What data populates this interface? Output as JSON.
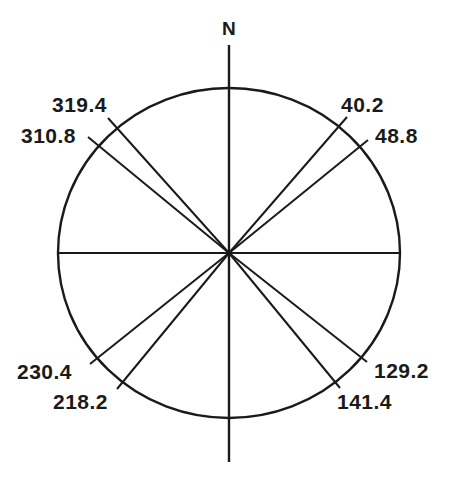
{
  "diagram": {
    "type": "compass-rose-orientation-diagram",
    "north_label": "N",
    "stroke_color": "#1a1a1a",
    "background": "#ffffff",
    "center": {
      "x": 229,
      "y": 253
    },
    "circle": {
      "rx": 171,
      "ry": 165
    },
    "axes": {
      "vertical": {
        "x": 229,
        "y1": 45,
        "y2": 462
      },
      "horizontal": {
        "y": 253,
        "x1": 58,
        "x2": 400
      }
    },
    "bearings": [
      {
        "label": "40.2",
        "end": {
          "x": 347,
          "y": 117
        },
        "label_pos": {
          "x": 341,
          "y": 94
        }
      },
      {
        "label": "48.8",
        "end": {
          "x": 368,
          "y": 140
        },
        "label_pos": {
          "x": 375,
          "y": 125
        }
      },
      {
        "label": "129.2",
        "end": {
          "x": 367,
          "y": 362
        },
        "label_pos": {
          "x": 374,
          "y": 360
        }
      },
      {
        "label": "141.4",
        "end": {
          "x": 340,
          "y": 388
        },
        "label_pos": {
          "x": 337,
          "y": 391
        }
      },
      {
        "label": "218.2",
        "end": {
          "x": 117,
          "y": 389
        },
        "label_pos": {
          "x": 53,
          "y": 391
        }
      },
      {
        "label": "230.4",
        "end": {
          "x": 90,
          "y": 364
        },
        "label_pos": {
          "x": 17,
          "y": 361
        }
      },
      {
        "label": "310.8",
        "end": {
          "x": 88,
          "y": 137
        },
        "label_pos": {
          "x": 21,
          "y": 125
        }
      },
      {
        "label": "319.4",
        "end": {
          "x": 108,
          "y": 118
        },
        "label_pos": {
          "x": 52,
          "y": 94
        }
      }
    ]
  }
}
